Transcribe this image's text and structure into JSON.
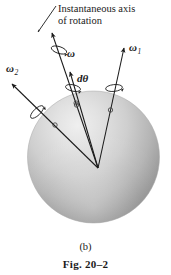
{
  "figure": {
    "panel_label": "(b)",
    "caption": "Fig. 20–2",
    "axis_annotation": {
      "line1": "Instantaneous axis",
      "line2": "of rotation"
    },
    "angle_label": "dθ",
    "vectors": [
      {
        "id": "omega",
        "symbol": "ω",
        "subscript": ""
      },
      {
        "id": "omega1",
        "symbol": "ω",
        "subscript": "1"
      },
      {
        "id": "omega2",
        "symbol": "ω",
        "subscript": "2"
      }
    ],
    "colors": {
      "background": "#ffffff",
      "ink": "#1a1a1a",
      "sphere_highlight": "#e9e9e9",
      "sphere_mid": "#c2c2c2",
      "sphere_shadow": "#8f8f8f"
    }
  }
}
